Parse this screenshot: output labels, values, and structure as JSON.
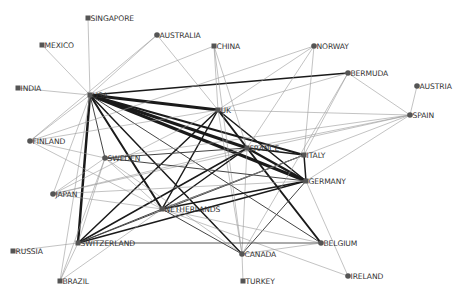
{
  "diagram": {
    "type": "network-graph",
    "colors": {
      "node": "#555555",
      "label": "#333333",
      "edge_strong": "#1a1a1a",
      "edge_weak": "#9a9a9a",
      "background": "#ffffff"
    },
    "nodes": [
      {
        "id": "SINGAPORE",
        "label": "SINGAPORE",
        "x": 88,
        "y": 18,
        "shape": "square"
      },
      {
        "id": "MEXICO",
        "label": "MEXICO",
        "x": 42,
        "y": 45,
        "shape": "square"
      },
      {
        "id": "AUSTRALIA",
        "label": "AUSTRALIA",
        "x": 157,
        "y": 35,
        "shape": "circle"
      },
      {
        "id": "CHINA",
        "label": "CHINA",
        "x": 214,
        "y": 46,
        "shape": "square"
      },
      {
        "id": "NORWAY",
        "label": "NORWAY",
        "x": 314,
        "y": 46,
        "shape": "circle"
      },
      {
        "id": "BERMUDA",
        "label": "BERMUDA",
        "x": 348,
        "y": 73,
        "shape": "circle"
      },
      {
        "id": "AUSTRIA",
        "label": "AUSTRIA",
        "x": 417,
        "y": 86,
        "shape": "circle"
      },
      {
        "id": "SPAIN",
        "label": "SPAIN",
        "x": 410,
        "y": 115,
        "shape": "circle"
      },
      {
        "id": "INDIA",
        "label": "INDIA",
        "x": 18,
        "y": 88,
        "shape": "square"
      },
      {
        "id": "USA",
        "label": "USA",
        "x": 90,
        "y": 95,
        "shape": "square"
      },
      {
        "id": "UK",
        "label": "UK",
        "x": 218,
        "y": 110,
        "shape": "square"
      },
      {
        "id": "FINLAND",
        "label": "FINLAND",
        "x": 30,
        "y": 141,
        "shape": "circle"
      },
      {
        "id": "SWEDEN",
        "label": "SWEDEN",
        "x": 105,
        "y": 158,
        "shape": "circle"
      },
      {
        "id": "FRANCE",
        "label": "FRANCE",
        "x": 247,
        "y": 148,
        "shape": "square"
      },
      {
        "id": "ITALY",
        "label": "ITALY",
        "x": 304,
        "y": 155,
        "shape": "square"
      },
      {
        "id": "GERMANY",
        "label": "GERMANY",
        "x": 306,
        "y": 181,
        "shape": "square"
      },
      {
        "id": "JAPAN",
        "label": "JAPAN",
        "x": 53,
        "y": 194,
        "shape": "circle"
      },
      {
        "id": "NETHERLANDS",
        "label": "NETHERLANDS",
        "x": 162,
        "y": 209,
        "shape": "square"
      },
      {
        "id": "SWITZERLAND",
        "label": "SWITZERLAND",
        "x": 78,
        "y": 243,
        "shape": "square"
      },
      {
        "id": "RUSSIA",
        "label": "RUSSIA",
        "x": 13,
        "y": 251,
        "shape": "square"
      },
      {
        "id": "CANADA",
        "label": "CANADA",
        "x": 242,
        "y": 254,
        "shape": "circle"
      },
      {
        "id": "BELGIUM",
        "label": "BELGIUM",
        "x": 321,
        "y": 243,
        "shape": "circle"
      },
      {
        "id": "IRELAND",
        "label": "IRELAND",
        "x": 348,
        "y": 276,
        "shape": "circle"
      },
      {
        "id": "BRAZIL",
        "label": "BRAZIL",
        "x": 60,
        "y": 281,
        "shape": "square"
      },
      {
        "id": "TURKEY",
        "label": "TURKEY",
        "x": 243,
        "y": 281,
        "shape": "square"
      }
    ],
    "edges": [
      {
        "from": "USA",
        "to": "UK",
        "weight": 3
      },
      {
        "from": "USA",
        "to": "FRANCE",
        "weight": 3
      },
      {
        "from": "USA",
        "to": "GERMANY",
        "weight": 3
      },
      {
        "from": "USA",
        "to": "ITALY",
        "weight": 2
      },
      {
        "from": "USA",
        "to": "SWITZERLAND",
        "weight": 2.5
      },
      {
        "from": "USA",
        "to": "NETHERLANDS",
        "weight": 2
      },
      {
        "from": "USA",
        "to": "CANADA",
        "weight": 1.5
      },
      {
        "from": "USA",
        "to": "SWEDEN",
        "weight": 1
      },
      {
        "from": "USA",
        "to": "BERMUDA",
        "weight": 1.5
      },
      {
        "from": "USA",
        "to": "SINGAPORE",
        "weight": 0.6
      },
      {
        "from": "USA",
        "to": "MEXICO",
        "weight": 0.6
      },
      {
        "from": "USA",
        "to": "INDIA",
        "weight": 0.6
      },
      {
        "from": "USA",
        "to": "AUSTRALIA",
        "weight": 0.6
      },
      {
        "from": "USA",
        "to": "CHINA",
        "weight": 0.6
      },
      {
        "from": "USA",
        "to": "JAPAN",
        "weight": 0.6
      },
      {
        "from": "USA",
        "to": "FINLAND",
        "weight": 0.6
      },
      {
        "from": "USA",
        "to": "BRAZIL",
        "weight": 0.6
      },
      {
        "from": "USA",
        "to": "BELGIUM",
        "weight": 1
      },
      {
        "from": "UK",
        "to": "FRANCE",
        "weight": 2
      },
      {
        "from": "UK",
        "to": "GERMANY",
        "weight": 1.5
      },
      {
        "from": "UK",
        "to": "NETHERLANDS",
        "weight": 1.5
      },
      {
        "from": "UK",
        "to": "SWITZERLAND",
        "weight": 1.5
      },
      {
        "from": "UK",
        "to": "AUSTRALIA",
        "weight": 0.6
      },
      {
        "from": "UK",
        "to": "CHINA",
        "weight": 0.6
      },
      {
        "from": "UK",
        "to": "NORWAY",
        "weight": 0.6
      },
      {
        "from": "UK",
        "to": "SPAIN",
        "weight": 0.6
      },
      {
        "from": "UK",
        "to": "FINLAND",
        "weight": 0.6
      },
      {
        "from": "UK",
        "to": "JAPAN",
        "weight": 0.6
      },
      {
        "from": "UK",
        "to": "CANADA",
        "weight": 0.6
      },
      {
        "from": "FRANCE",
        "to": "GERMANY",
        "weight": 2.5
      },
      {
        "from": "FRANCE",
        "to": "ITALY",
        "weight": 1.5
      },
      {
        "from": "FRANCE",
        "to": "SWITZERLAND",
        "weight": 1.5
      },
      {
        "from": "FRANCE",
        "to": "NETHERLANDS",
        "weight": 1.5
      },
      {
        "from": "FRANCE",
        "to": "BELGIUM",
        "weight": 2
      },
      {
        "from": "FRANCE",
        "to": "SWEDEN",
        "weight": 1
      },
      {
        "from": "FRANCE",
        "to": "SPAIN",
        "weight": 0.6
      },
      {
        "from": "FRANCE",
        "to": "JAPAN",
        "weight": 0.6
      },
      {
        "from": "FRANCE",
        "to": "CHINA",
        "weight": 0.6
      },
      {
        "from": "FRANCE",
        "to": "CANADA",
        "weight": 0.6
      },
      {
        "from": "GERMANY",
        "to": "NETHERLANDS",
        "weight": 1.5
      },
      {
        "from": "GERMANY",
        "to": "SWITZERLAND",
        "weight": 1.5
      },
      {
        "from": "GERMANY",
        "to": "ITALY",
        "weight": 1.5
      },
      {
        "from": "GERMANY",
        "to": "CANADA",
        "weight": 1
      },
      {
        "from": "GERMANY",
        "to": "IRELAND",
        "weight": 0.6
      },
      {
        "from": "GERMANY",
        "to": "SPAIN",
        "weight": 0.6
      },
      {
        "from": "GERMANY",
        "to": "SWEDEN",
        "weight": 1
      },
      {
        "from": "GERMANY",
        "to": "JAPAN",
        "weight": 0.6
      },
      {
        "from": "ITALY",
        "to": "SWITZERLAND",
        "weight": 1
      },
      {
        "from": "ITALY",
        "to": "BERMUDA",
        "weight": 0.6
      },
      {
        "from": "ITALY",
        "to": "NORWAY",
        "weight": 0.6
      },
      {
        "from": "ITALY",
        "to": "NETHERLANDS",
        "weight": 1
      },
      {
        "from": "SPAIN",
        "to": "AUSTRIA",
        "weight": 0.6
      },
      {
        "from": "SPAIN",
        "to": "BERMUDA",
        "weight": 0.6
      },
      {
        "from": "SPAIN",
        "to": "SWEDEN",
        "weight": 0.6
      },
      {
        "from": "SPAIN",
        "to": "NETHERLANDS",
        "weight": 0.6
      },
      {
        "from": "SPAIN",
        "to": "JAPAN",
        "weight": 0.6
      },
      {
        "from": "BERMUDA",
        "to": "CANADA",
        "weight": 0.6
      },
      {
        "from": "BERMUDA",
        "to": "UK",
        "weight": 0.6
      },
      {
        "from": "NORWAY",
        "to": "FRANCE",
        "weight": 0.6
      },
      {
        "from": "NETHERLANDS",
        "to": "SWITZERLAND",
        "weight": 1
      },
      {
        "from": "NETHERLANDS",
        "to": "CANADA",
        "weight": 1
      },
      {
        "from": "NETHERLANDS",
        "to": "BELGIUM",
        "weight": 0.6
      },
      {
        "from": "NETHERLANDS",
        "to": "SWEDEN",
        "weight": 0.6
      },
      {
        "from": "NETHERLANDS",
        "to": "IRELAND",
        "weight": 0.6
      },
      {
        "from": "NETHERLANDS",
        "to": "JAPAN",
        "weight": 0.6
      },
      {
        "from": "NETHERLANDS",
        "to": "FINLAND",
        "weight": 0.6
      },
      {
        "from": "SWITZERLAND",
        "to": "BELGIUM",
        "weight": 0.9
      },
      {
        "from": "SWITZERLAND",
        "to": "RUSSIA",
        "weight": 0.6
      },
      {
        "from": "SWITZERLAND",
        "to": "BRAZIL",
        "weight": 0.6
      },
      {
        "from": "SWITZERLAND",
        "to": "SWEDEN",
        "weight": 0.6
      },
      {
        "from": "CANADA",
        "to": "TURKEY",
        "weight": 0.6
      },
      {
        "from": "CANADA",
        "to": "BELGIUM",
        "weight": 0.6
      },
      {
        "from": "CANADA",
        "to": "SWEDEN",
        "weight": 0.6
      },
      {
        "from": "CANADA",
        "to": "CHINA",
        "weight": 0.6
      },
      {
        "from": "BRAZIL",
        "to": "SWEDEN",
        "weight": 0.6
      },
      {
        "from": "BRAZIL",
        "to": "NETHERLANDS",
        "weight": 0.6
      },
      {
        "from": "JAPAN",
        "to": "SWEDEN",
        "weight": 0.6
      },
      {
        "from": "FINLAND",
        "to": "SWEDEN",
        "weight": 0.6
      },
      {
        "from": "AUSTRALIA",
        "to": "FINLAND",
        "weight": 0.6
      },
      {
        "from": "NORWAY",
        "to": "FINLAND",
        "weight": 0.6
      }
    ]
  }
}
